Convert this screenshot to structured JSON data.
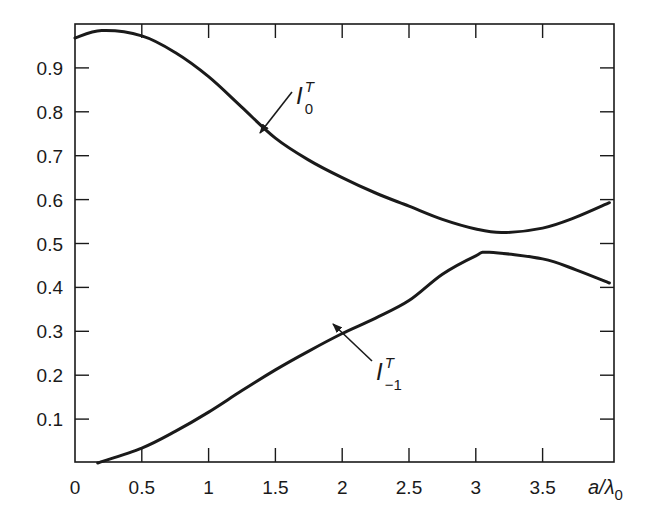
{
  "chart_data": {
    "type": "line",
    "title": "",
    "xlabel": "a/λ0",
    "ylabel": "",
    "xlim": [
      0,
      4.03
    ],
    "ylim": [
      0,
      1.0
    ],
    "grid": false,
    "legend": "inline annotations with arrows",
    "x_ticks": [
      "0",
      "0.5",
      "1",
      "1.5",
      "2",
      "2.5",
      "3",
      "3.5"
    ],
    "y_ticks": [
      "0.1",
      "0.2",
      "0.3",
      "0.4",
      "0.5",
      "0.6",
      "0.7",
      "0.8",
      "0.9"
    ],
    "series": [
      {
        "name": "I_0^T",
        "label_main": "I",
        "label_sub": "0",
        "label_sup": "T",
        "x": [
          0,
          0.2,
          0.5,
          0.75,
          1.0,
          1.25,
          1.5,
          1.75,
          2.0,
          2.25,
          2.5,
          2.75,
          3.0,
          3.2,
          3.5,
          3.75,
          4.0
        ],
        "y": [
          0.968,
          0.985,
          0.973,
          0.935,
          0.88,
          0.81,
          0.74,
          0.69,
          0.65,
          0.615,
          0.585,
          0.555,
          0.533,
          0.525,
          0.535,
          0.56,
          0.593
        ]
      },
      {
        "name": "I_-1^T",
        "label_main": "I",
        "label_sub": "−1",
        "label_sup": "T",
        "x": [
          0.17,
          0.5,
          0.75,
          1.0,
          1.25,
          1.5,
          1.75,
          2.0,
          2.25,
          2.5,
          2.75,
          3.0,
          3.1,
          3.5,
          3.75,
          4.0
        ],
        "y": [
          0.0,
          0.034,
          0.072,
          0.116,
          0.165,
          0.212,
          0.255,
          0.295,
          0.33,
          0.37,
          0.43,
          0.472,
          0.48,
          0.465,
          0.44,
          0.41
        ]
      }
    ]
  }
}
